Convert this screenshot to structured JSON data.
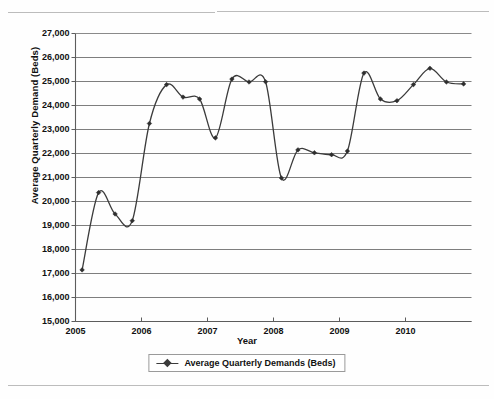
{
  "page": {
    "background_color": "#fefefe",
    "rule_color": "#bcbcbc"
  },
  "chart_data": {
    "type": "line",
    "title": "",
    "xlabel": "Year",
    "ylabel": "Average Quarterly Demand (Beds)",
    "xlim": [
      2005.0,
      2011.0
    ],
    "ylim": [
      15000,
      27000
    ],
    "grid": true,
    "grid_axis": "y",
    "legend_position": "bottom-center",
    "line_color": "#3b3b3b",
    "marker": "diamond",
    "series": [
      {
        "name": "Average Quarterly Demands (Beds)",
        "x": [
          2005.1,
          2005.35,
          2005.6,
          2005.86,
          2006.12,
          2006.38,
          2006.63,
          2006.88,
          2007.12,
          2007.37,
          2007.63,
          2007.88,
          2008.12,
          2008.37,
          2008.62,
          2008.88,
          2009.12,
          2009.37,
          2009.62,
          2009.87,
          2010.12,
          2010.37,
          2010.62,
          2010.88
        ],
        "values": [
          17150,
          20370,
          19480,
          19200,
          23250,
          24870,
          24350,
          24270,
          22650,
          25100,
          24980,
          24990,
          20980,
          22150,
          22030,
          21950,
          22100,
          25350,
          24270,
          24200,
          24870,
          25550,
          24980,
          24900
        ]
      }
    ],
    "yticks": [
      15000,
      16000,
      17000,
      18000,
      19000,
      20000,
      21000,
      22000,
      23000,
      24000,
      25000,
      26000,
      27000
    ],
    "ytick_labels": [
      "15,000",
      "16,000",
      "17,000",
      "18,000",
      "19,000",
      "20,000",
      "21,000",
      "22,000",
      "23,000",
      "24,000",
      "25,000",
      "26,000",
      "27,000"
    ],
    "xticks": [
      2005,
      2006,
      2007,
      2008,
      2009,
      2010
    ],
    "xtick_labels": [
      "2005",
      "2006",
      "2007",
      "2008",
      "2009",
      "2010"
    ]
  },
  "legend": {
    "entries": [
      {
        "label": "Average Quarterly Demands (Beds)",
        "marker": "line-diamond-marker"
      }
    ]
  }
}
